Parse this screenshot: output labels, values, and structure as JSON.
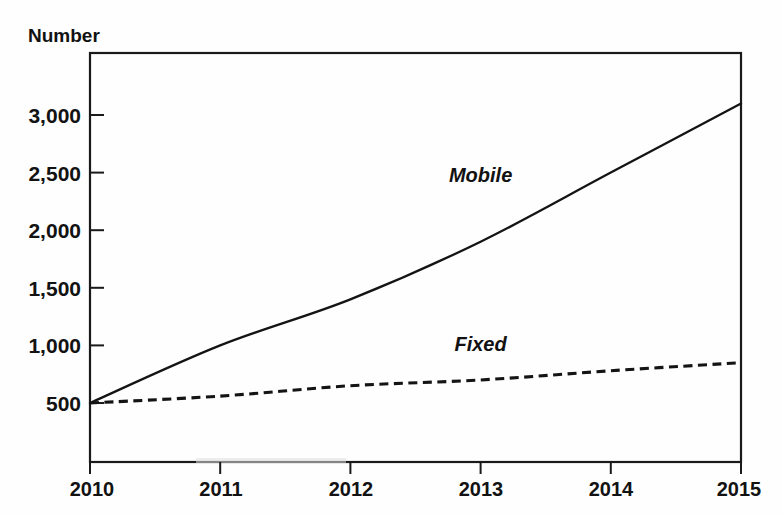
{
  "chart_data": {
    "type": "line",
    "title": "Number",
    "xlabel": "",
    "ylabel": "Number",
    "x": [
      2010,
      2011,
      2012,
      2013,
      2014,
      2015
    ],
    "categories": [
      "2010",
      "2011",
      "2012",
      "2013",
      "2014",
      "2015"
    ],
    "xtick_labels": [
      "2010",
      "2011",
      "2012",
      "2013",
      "2014",
      "2015"
    ],
    "ytick_labels": [
      "500",
      "1,000",
      "1,500",
      "2,000",
      "2,500",
      "3,000"
    ],
    "ytick_values": [
      500,
      1000,
      1500,
      2000,
      2500,
      3000
    ],
    "xlim": [
      2010,
      2015
    ],
    "ylim": [
      150,
      3450
    ],
    "grid": false,
    "legend_position": "inline-annotation",
    "series": [
      {
        "name": "Mobile",
        "style": "solid",
        "color": "#141414",
        "values": [
          500,
          1000,
          1400,
          1900,
          2500,
          3100
        ],
        "label_x": 2013.0,
        "label_y": 2420
      },
      {
        "name": "Fixed",
        "style": "dashed",
        "color": "#141414",
        "values": [
          500,
          560,
          650,
          700,
          780,
          850
        ],
        "label_x": 2013.0,
        "label_y": 950
      }
    ]
  },
  "axis": {
    "y_axis_caption": "Number"
  },
  "annotations": {
    "mobile_label": "Mobile",
    "fixed_label": "Fixed"
  },
  "colors": {
    "ink": "#141414",
    "frame": "#1a1a1a",
    "background": "#fefefe"
  }
}
